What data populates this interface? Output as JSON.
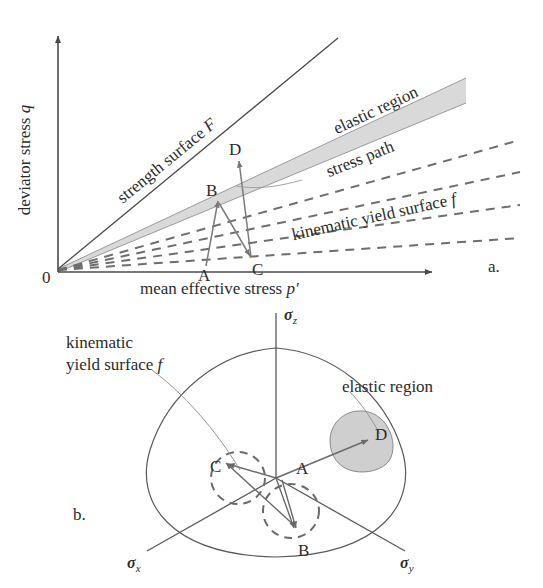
{
  "figure": {
    "panel_a": {
      "tag": "a.",
      "axes": {
        "y_label_text": "deviator stress ",
        "y_label_symbol": "q",
        "x_label_text": "mean effective stress ",
        "x_label_symbol": "p′",
        "origin_label": "0"
      },
      "annotations": {
        "strength_surface": "strength surface ",
        "strength_surface_symbol": "F",
        "elastic_region": "elastic region",
        "stress_path": "stress path",
        "kinematic_yield_surface": "kinematic yield surface ",
        "kinematic_yield_surface_symbol": "f"
      },
      "stress_path_points": [
        {
          "id": "A",
          "x": 206,
          "y": 264
        },
        {
          "id": "B",
          "x": 218,
          "y": 200
        },
        {
          "id": "C",
          "x": 252,
          "y": 258
        },
        {
          "id": "D",
          "x": 240,
          "y": 158
        }
      ],
      "colors": {
        "axis": "#4a4a4a",
        "line": "#4a4a4a",
        "dashed": "#6e6e6e",
        "band_fill": "#d9d9d9",
        "path": "#777777",
        "text": "#2b2b2b"
      }
    },
    "panel_b": {
      "tag": "b.",
      "axes": [
        {
          "id": "sigma-z",
          "symbol": "σ",
          "subscript": "z"
        },
        {
          "id": "sigma-x",
          "symbol": "σ",
          "subscript": "x"
        },
        {
          "id": "sigma-y",
          "symbol": "σ",
          "subscript": "y"
        }
      ],
      "annotations": {
        "kinematic_line1": "kinematic",
        "kinematic_line2": "yield surface ",
        "kinematic_symbol": "f",
        "elastic_region": "elastic region"
      },
      "points": [
        {
          "id": "A"
        },
        {
          "id": "B"
        },
        {
          "id": "C"
        },
        {
          "id": "D"
        }
      ],
      "colors": {
        "outline": "#5a5a5a",
        "dashed": "#6a6a6a",
        "blob_fill": "#cfcfcf",
        "arrow": "#6a6a6a",
        "text": "#2b2b2b"
      }
    }
  }
}
